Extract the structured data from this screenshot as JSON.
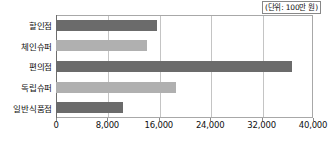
{
  "caption": {
    "unit_note": "(단위: 100만 원)"
  },
  "chart_data": {
    "type": "bar",
    "orientation": "horizontal",
    "title": "",
    "subtitle": "",
    "xlabel": "",
    "ylabel": "",
    "unit_note": "(단위: 100만 원)",
    "categories": [
      "할인점",
      "체인슈퍼",
      "편의점",
      "독립슈퍼",
      "일반식품점"
    ],
    "values": [
      15700,
      14200,
      36700,
      18700,
      10400
    ],
    "bar_colors": [
      "#6b6b6b",
      "#b0b0b0",
      "#6b6b6b",
      "#b0b0b0",
      "#6b6b6b"
    ],
    "xlim": [
      0,
      40000
    ],
    "xticks": [
      0,
      8000,
      16000,
      24000,
      32000,
      40000
    ],
    "xtick_labels": [
      "0",
      "8,000",
      "16,000",
      "24,000",
      "32,000",
      "40,000"
    ],
    "grid": true,
    "grid_axis": "x",
    "legend": false,
    "legend_position": "none",
    "colors": {
      "bar_dark": "#6b6b6b",
      "bar_light": "#b0b0b0",
      "gridline": "#c4c4c4",
      "frame": "#a8a8a8",
      "axis": "#6d6d6d",
      "text": "#111111",
      "background": "#ffffff"
    }
  }
}
